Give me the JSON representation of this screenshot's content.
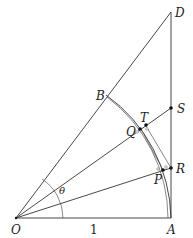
{
  "diagram": {
    "points": {
      "O": "O",
      "A": "A",
      "B": "B",
      "D": "D",
      "P": "P",
      "Q": "Q",
      "R": "R",
      "S": "S",
      "T": "T"
    },
    "angle_label": "θ",
    "length_label": "1",
    "colors": {
      "line": "#333333",
      "point": "#111111"
    }
  }
}
